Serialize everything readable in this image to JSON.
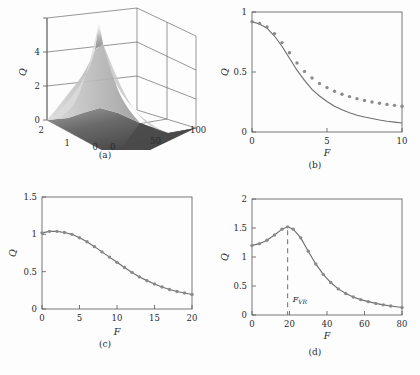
{
  "figure": {
    "panels": [
      {
        "id": "a",
        "caption": "(a)"
      },
      {
        "id": "b",
        "caption": "(b)"
      },
      {
        "id": "c",
        "caption": "(c)"
      },
      {
        "id": "d",
        "caption": "(d)"
      }
    ]
  },
  "chart_data": [
    {
      "type": "surface",
      "panel": "a",
      "title": "",
      "xlabel": "α",
      "ylabel": "F",
      "zlabel": "Q",
      "xlim": [
        0,
        2
      ],
      "ylim": [
        0,
        100
      ],
      "zlim": [
        0,
        4
      ],
      "xticks": [
        2,
        1,
        0
      ],
      "yticks": [
        0,
        50,
        100
      ],
      "zticks": [
        0,
        2,
        4
      ],
      "grid": true,
      "colormap": "grayscale",
      "description": "Q as a joint function of alpha and F; a sharp white ridge peak near alpha=1, small F reaching Q about 4, decaying to a dark near-zero plateau at large F.",
      "peak": {
        "alpha": 1.0,
        "F": 5,
        "Q": 4.0
      }
    },
    {
      "type": "line",
      "panel": "b",
      "title": "",
      "xlabel": "F",
      "ylabel": "Q",
      "xlim": [
        0,
        10
      ],
      "ylim": [
        0,
        1
      ],
      "xticks": [
        0,
        5,
        10
      ],
      "yticks": [
        0,
        0.5,
        1
      ],
      "grid": false,
      "x": [
        0,
        0.5,
        1,
        1.5,
        2,
        2.5,
        3,
        3.5,
        4,
        4.5,
        5,
        5.5,
        6,
        6.5,
        7,
        7.5,
        8,
        8.5,
        9,
        9.5,
        10
      ],
      "series": [
        {
          "name": "theory",
          "style": "solid-line",
          "values": [
            0.92,
            0.9,
            0.865,
            0.8,
            0.715,
            0.615,
            0.515,
            0.43,
            0.355,
            0.3,
            0.255,
            0.215,
            0.185,
            0.16,
            0.14,
            0.125,
            0.112,
            0.1,
            0.09,
            0.082,
            0.075
          ]
        },
        {
          "name": "simulation",
          "style": "dots",
          "values": [
            0.92,
            0.905,
            0.875,
            0.82,
            0.745,
            0.66,
            0.575,
            0.505,
            0.45,
            0.405,
            0.37,
            0.34,
            0.315,
            0.295,
            0.278,
            0.263,
            0.25,
            0.24,
            0.23,
            0.222,
            0.215
          ]
        }
      ]
    },
    {
      "type": "line",
      "panel": "c",
      "title": "",
      "xlabel": "F",
      "ylabel": "Q",
      "xlim": [
        0,
        20
      ],
      "ylim": [
        0,
        1.5
      ],
      "xticks": [
        0,
        5,
        10,
        15,
        20
      ],
      "yticks": [
        0,
        0.5,
        1,
        1.5
      ],
      "grid": false,
      "x": [
        0,
        1,
        2,
        3,
        4,
        5,
        6,
        7,
        8,
        9,
        10,
        11,
        12,
        13,
        14,
        15,
        16,
        17,
        18,
        19,
        20
      ],
      "series": [
        {
          "name": "theory",
          "style": "solid-line",
          "values": [
            1.02,
            1.04,
            1.04,
            1.025,
            1.0,
            0.955,
            0.9,
            0.835,
            0.765,
            0.695,
            0.625,
            0.555,
            0.49,
            0.43,
            0.38,
            0.335,
            0.295,
            0.262,
            0.235,
            0.215,
            0.195
          ]
        },
        {
          "name": "simulation",
          "style": "dots",
          "values": [
            1.02,
            1.04,
            1.04,
            1.025,
            1.0,
            0.955,
            0.9,
            0.835,
            0.765,
            0.695,
            0.625,
            0.555,
            0.49,
            0.43,
            0.38,
            0.335,
            0.295,
            0.262,
            0.235,
            0.215,
            0.195
          ]
        }
      ]
    },
    {
      "type": "line",
      "panel": "d",
      "title": "",
      "xlabel": "F",
      "ylabel": "Q",
      "xlim": [
        0,
        80
      ],
      "ylim": [
        0,
        2
      ],
      "xticks": [
        0,
        20,
        40,
        60,
        80
      ],
      "yticks": [
        0,
        0.5,
        1,
        1.5,
        2
      ],
      "grid": false,
      "annotation": {
        "label": "F",
        "sublabel": "VR",
        "x": 19,
        "type": "vertical-dashed-line"
      },
      "x": [
        0,
        4,
        8,
        12,
        16,
        19,
        22,
        26,
        30,
        34,
        38,
        42,
        46,
        50,
        54,
        58,
        62,
        66,
        70,
        74,
        80
      ],
      "series": [
        {
          "name": "theory",
          "style": "solid-line",
          "values": [
            1.2,
            1.23,
            1.29,
            1.38,
            1.48,
            1.52,
            1.48,
            1.33,
            1.1,
            0.88,
            0.7,
            0.56,
            0.45,
            0.37,
            0.31,
            0.265,
            0.23,
            0.2,
            0.175,
            0.155,
            0.13
          ]
        },
        {
          "name": "simulation",
          "style": "dots",
          "values": [
            1.2,
            1.23,
            1.29,
            1.38,
            1.48,
            1.52,
            1.48,
            1.33,
            1.1,
            0.88,
            0.7,
            0.56,
            0.45,
            0.37,
            0.31,
            0.265,
            0.23,
            0.2,
            0.175,
            0.155,
            0.13
          ]
        }
      ]
    }
  ]
}
